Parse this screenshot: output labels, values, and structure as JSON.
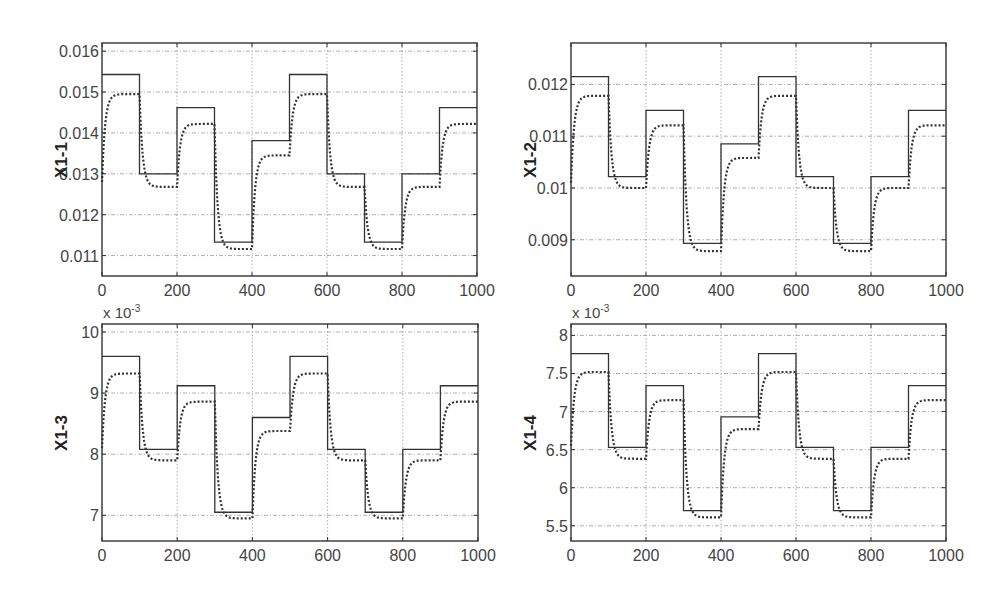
{
  "chart_data": [
    {
      "type": "line",
      "title": "",
      "ylabel": "X1-1",
      "xlabel": "",
      "exponent_label": "",
      "xlim": [
        0,
        1000
      ],
      "ylim": [
        0.0105,
        0.0162
      ],
      "xticks": [
        0,
        200,
        400,
        600,
        800,
        1000
      ],
      "yticks": [
        0.011,
        0.012,
        0.013,
        0.014,
        0.015,
        0.016
      ],
      "ytick_labels": [
        "0.011",
        "0.012",
        "0.013",
        "0.014",
        "0.015",
        "0.016"
      ],
      "grid": true,
      "step_edges": [
        0,
        100,
        200,
        300,
        400,
        500,
        600,
        700,
        800,
        900,
        1000
      ],
      "series": [
        {
          "name": "reference (solid)",
          "style": "solid",
          "values": [
            0.01543,
            0.013,
            0.01462,
            0.01133,
            0.01381,
            0.01543,
            0.013,
            0.01133,
            0.013,
            0.01462
          ]
        },
        {
          "name": "response (dotted)",
          "style": "dotted",
          "start": 0.0128,
          "values": [
            0.01495,
            0.01268,
            0.01422,
            0.01116,
            0.01345,
            0.01495,
            0.01268,
            0.01116,
            0.01268,
            0.01422
          ]
        }
      ]
    },
    {
      "type": "line",
      "title": "",
      "ylabel": "X1-2",
      "xlabel": "",
      "exponent_label": "",
      "xlim": [
        0,
        1000
      ],
      "ylim": [
        0.0083,
        0.0128
      ],
      "xticks": [
        0,
        200,
        400,
        600,
        800,
        1000
      ],
      "yticks": [
        0.009,
        0.01,
        0.011,
        0.012
      ],
      "ytick_labels": [
        "0.009",
        "0.01",
        "0.011",
        "0.012"
      ],
      "grid": true,
      "step_edges": [
        0,
        100,
        200,
        300,
        400,
        500,
        600,
        700,
        800,
        900,
        1000
      ],
      "series": [
        {
          "name": "reference (solid)",
          "style": "solid",
          "values": [
            0.01215,
            0.01022,
            0.0115,
            0.00893,
            0.01085,
            0.01215,
            0.01022,
            0.00893,
            0.01022,
            0.0115
          ]
        },
        {
          "name": "response (dotted)",
          "style": "dotted",
          "start": 0.0101,
          "values": [
            0.01178,
            0.01,
            0.01121,
            0.00878,
            0.01058,
            0.01178,
            0.01,
            0.00878,
            0.01,
            0.01121
          ]
        }
      ]
    },
    {
      "type": "line",
      "title": "",
      "ylabel": "X1-3",
      "xlabel": "",
      "exponent_label": "x 10-3",
      "exponent_base": "x 10",
      "exponent_power": "-3",
      "xlim": [
        0,
        1000
      ],
      "ylim": [
        6.58,
        10.13
      ],
      "xticks": [
        0,
        200,
        400,
        600,
        800,
        1000
      ],
      "yticks": [
        7,
        8,
        9,
        10
      ],
      "ytick_labels": [
        "7",
        "8",
        "9",
        "10"
      ],
      "grid": true,
      "step_edges": [
        0,
        100,
        200,
        300,
        400,
        500,
        600,
        700,
        800,
        900,
        1000
      ],
      "series": [
        {
          "name": "reference (solid)",
          "style": "solid",
          "values": [
            9.6,
            8.08,
            9.12,
            7.05,
            8.6,
            9.6,
            8.08,
            7.05,
            8.08,
            9.12
          ]
        },
        {
          "name": "response (dotted)",
          "style": "dotted",
          "start": 8.1,
          "values": [
            9.32,
            7.9,
            8.86,
            6.95,
            8.38,
            9.32,
            7.9,
            6.95,
            7.9,
            8.86
          ]
        }
      ]
    },
    {
      "type": "line",
      "title": "",
      "ylabel": "X1-4",
      "xlabel": "",
      "exponent_label": "x 10-3",
      "exponent_base": "x 10",
      "exponent_power": "-3",
      "xlim": [
        0,
        1000
      ],
      "ylim": [
        5.3,
        8.15
      ],
      "xticks": [
        0,
        200,
        400,
        600,
        800,
        1000
      ],
      "yticks": [
        5.5,
        6,
        6.5,
        7,
        7.5,
        8
      ],
      "ytick_labels": [
        "5.5",
        "6",
        "6.5",
        "7",
        "7.5",
        "8"
      ],
      "grid": true,
      "step_edges": [
        0,
        100,
        200,
        300,
        400,
        500,
        600,
        700,
        800,
        900,
        1000
      ],
      "series": [
        {
          "name": "reference (solid)",
          "style": "solid",
          "values": [
            7.76,
            6.53,
            7.34,
            5.7,
            6.93,
            7.76,
            6.53,
            5.7,
            6.53,
            7.34
          ]
        },
        {
          "name": "response (dotted)",
          "style": "dotted",
          "start": 6.55,
          "values": [
            7.52,
            6.38,
            7.15,
            5.61,
            6.77,
            7.52,
            6.38,
            5.61,
            6.38,
            7.15
          ]
        }
      ]
    }
  ],
  "style": {
    "axis_color": "#333333",
    "grid_color": "#9a9a9a",
    "line_color": "#333333",
    "background": "#ffffff"
  }
}
